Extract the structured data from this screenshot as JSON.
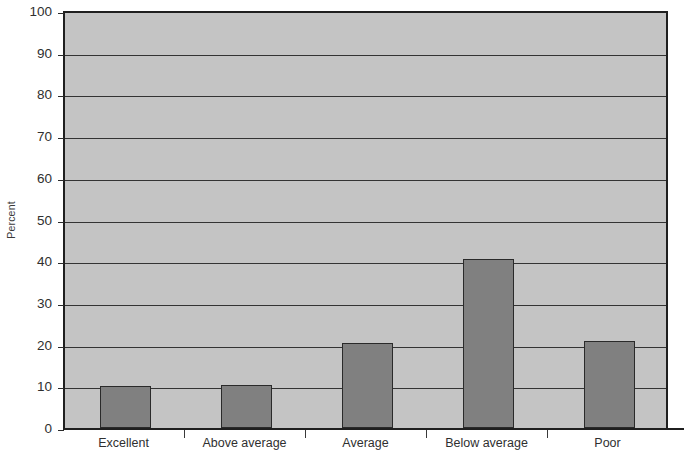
{
  "chart_data": {
    "type": "bar",
    "title": "",
    "xlabel": "",
    "ylabel": "Percent",
    "categories": [
      "Excellent",
      "Above average",
      "Average",
      "Below average",
      "Poor"
    ],
    "values": [
      10,
      10.3,
      20.3,
      40.5,
      20.8
    ],
    "ylim": [
      0,
      100
    ],
    "ytick_labels": [
      "0",
      "10",
      "20",
      "30",
      "40",
      "50",
      "60",
      "70",
      "80",
      "90",
      "100"
    ],
    "ytick_values": [
      0,
      10,
      20,
      30,
      40,
      50,
      60,
      70,
      80,
      90,
      100
    ],
    "grid": "horizontal",
    "legend": "none",
    "colors": {
      "bar_fill": "#808080",
      "bar_border": "#2a2a2a",
      "plot_background": "#c4c4c4",
      "axis": "#1f1f1f",
      "gridline": "#333333",
      "text": "#2f2f2f",
      "page_background": "#ffffff"
    }
  }
}
